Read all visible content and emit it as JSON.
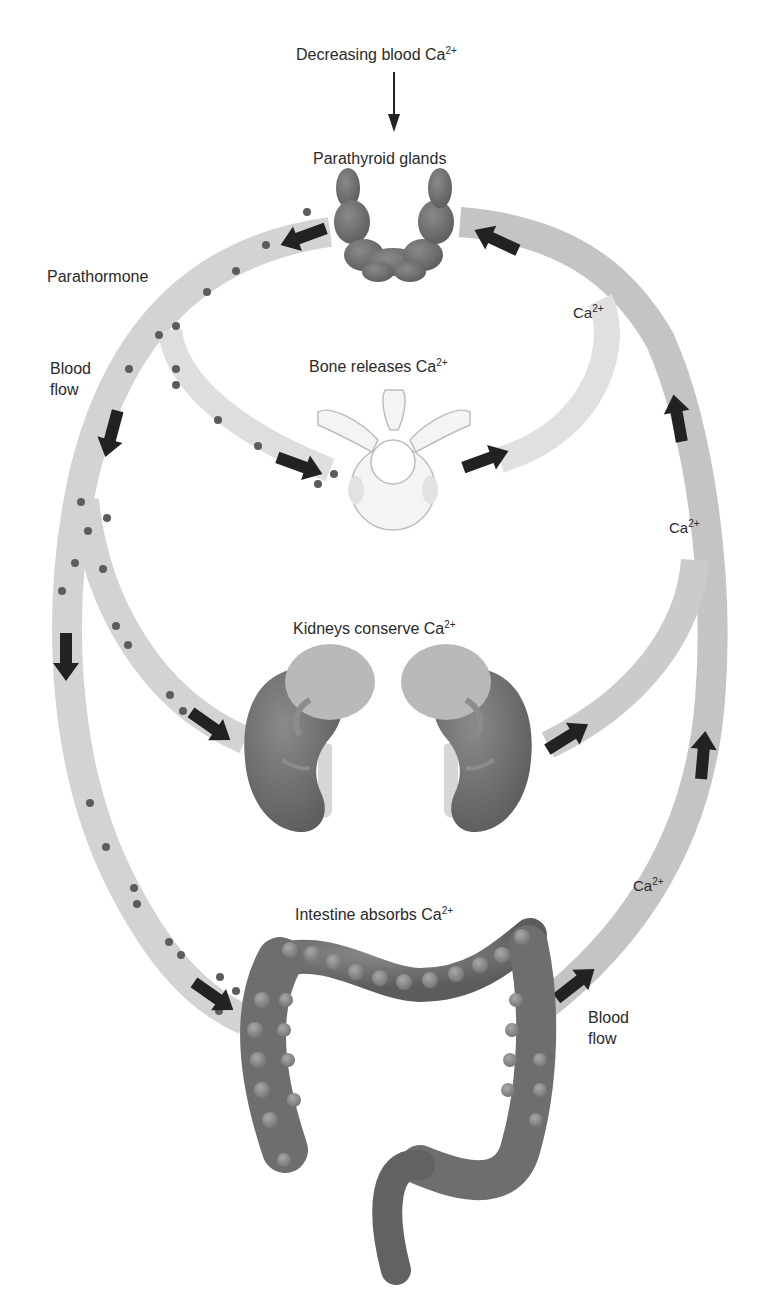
{
  "title": "Decreasing blood Ca",
  "title_sup": "2+",
  "labels": {
    "parathyroid": "Parathyroid glands",
    "parathormone": "Parathormone",
    "blood_flow_left_1": "Blood",
    "blood_flow_left_2": "flow",
    "bone": "Bone releases Ca",
    "bone_sup": "2+",
    "kidneys": "Kidneys conserve Ca",
    "kidneys_sup": "2+",
    "intestine": "Intestine absorbs Ca",
    "intestine_sup": "2+",
    "blood_flow_right_1": "Blood",
    "blood_flow_right_2": "flow",
    "ion_1": "Ca",
    "ion_1_sup": "2+",
    "ion_2": "Ca",
    "ion_2_sup": "2+",
    "ion_3": "Ca",
    "ion_3_sup": "2+"
  },
  "organs": [
    "parathyroid-glands",
    "vertebra-bone",
    "left-kidney",
    "right-kidney",
    "large-intestine"
  ],
  "colors": {
    "arc_light": "#d6d6d6",
    "arc_dark": "#b9b9b9",
    "organ": "#6e6e6e",
    "organ_light": "#9a9a9a",
    "arrow": "#222222",
    "hormone_dot": "#5a5a5a",
    "bone": "#f3f3f3"
  }
}
